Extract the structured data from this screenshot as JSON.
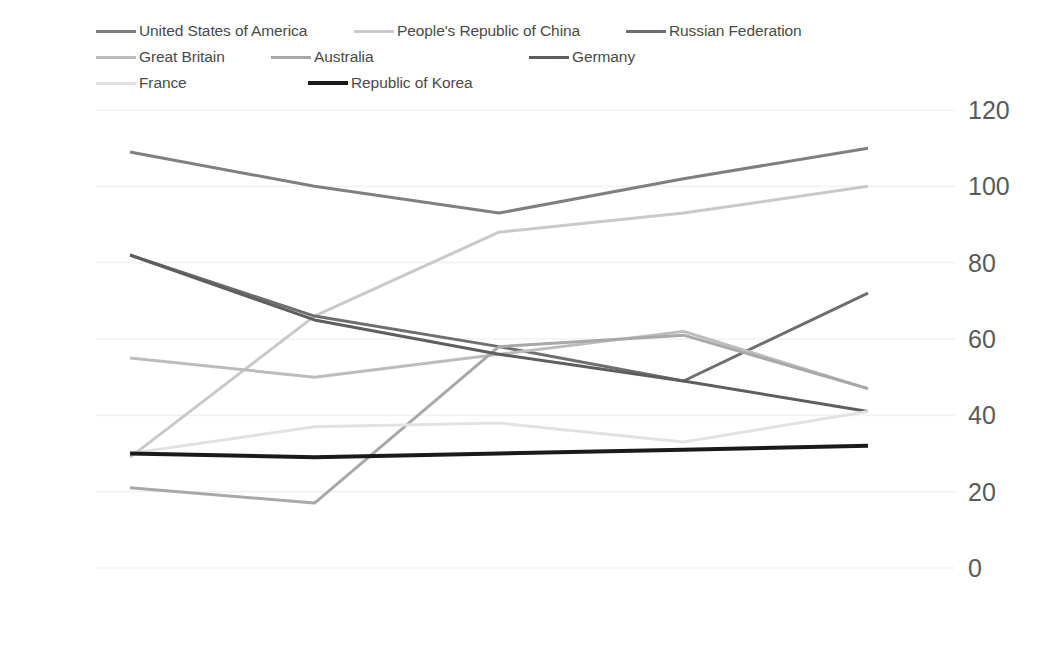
{
  "chart_data": {
    "type": "line",
    "title": "",
    "subtitle": "",
    "xlabel": "",
    "ylabel": "",
    "categories": [
      "1992",
      "1996",
      "2000",
      "2004",
      "2008"
    ],
    "x": [
      1992,
      1996,
      2000,
      2004,
      2008
    ],
    "ylim": [
      0,
      120
    ],
    "yticks": [
      "0",
      "20",
      "40",
      "60",
      "80",
      "100",
      "120"
    ],
    "ytick_values": [
      0,
      20,
      40,
      60,
      80,
      100,
      120
    ],
    "grid": true,
    "grid_axis": "y",
    "legend_position": "top",
    "series": [
      {
        "name": "United States of America",
        "values": [
          109,
          100,
          93,
          102,
          110
        ],
        "color": "#7f7f7f",
        "width": 3.0
      },
      {
        "name": "People's Republic of China",
        "values": [
          29,
          66,
          88,
          93,
          100
        ],
        "color": "#c9c9c9",
        "width": 3.0
      },
      {
        "name": "Russian Federation",
        "values": [
          82,
          66,
          58,
          49,
          72
        ],
        "color": "#6e6e6e",
        "width": 3.0
      },
      {
        "name": "Great Britain",
        "values": [
          55,
          50,
          56,
          62,
          47
        ],
        "color": "#bcbcbc",
        "width": 3.0
      },
      {
        "name": "Australia",
        "values": [
          21,
          17,
          58,
          61,
          47
        ],
        "color": "#a8a8a8",
        "width": 3.0
      },
      {
        "name": "Germany",
        "values": [
          82,
          65,
          56,
          49,
          41
        ],
        "color": "#5e5e5e",
        "width": 3.0
      },
      {
        "name": "France",
        "values": [
          30,
          37,
          38,
          33,
          41
        ],
        "color": "#e2e2e2",
        "width": 3.0
      },
      {
        "name": "Republic of Korea",
        "values": [
          30,
          29,
          30,
          31,
          32
        ],
        "color": "#1a1a1a",
        "width": 4.0
      }
    ]
  },
  "legend": {
    "items": [
      {
        "label": "United States of America",
        "color": "#7f7f7f",
        "width": 3.0
      },
      {
        "label": "People's Republic of China",
        "color": "#c9c9c9",
        "width": 3.0
      },
      {
        "label": "Russian Federation",
        "color": "#6e6e6e",
        "width": 3.0
      },
      {
        "label": "Great Britain",
        "color": "#bcbcbc",
        "width": 3.0
      },
      {
        "label": "Australia",
        "color": "#a8a8a8",
        "width": 3.0
      },
      {
        "label": "Germany",
        "color": "#5e5e5e",
        "width": 3.0
      },
      {
        "label": "France",
        "color": "#e2e2e2",
        "width": 3.0
      },
      {
        "label": "Republic of Korea",
        "color": "#1a1a1a",
        "width": 4.0
      }
    ]
  },
  "axes": {
    "y_labels": [
      "120",
      "100",
      "80",
      "60",
      "40",
      "20",
      "0"
    ],
    "x_labels": [
      "1992",
      "1996",
      "2000",
      "2004",
      "2008"
    ]
  },
  "style": {
    "background": "#ffffff",
    "gridline_color": "#f2f2f2",
    "tick_text_color": "#5a5a5a",
    "legend_text_color": "#4a4a4a"
  }
}
